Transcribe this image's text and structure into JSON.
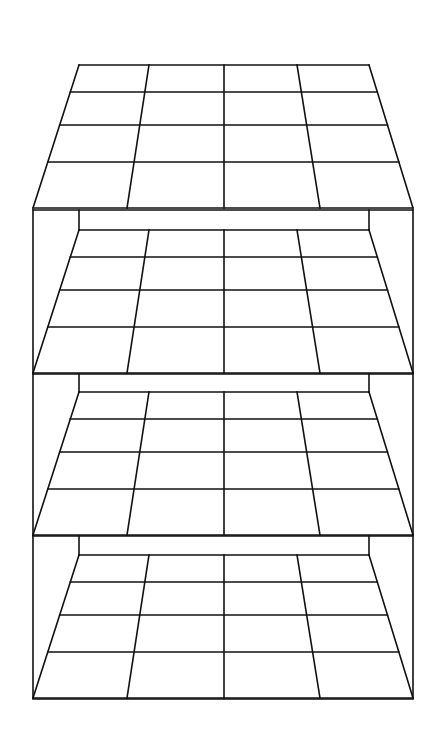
{
  "diagram": {
    "title": "",
    "stroke_color": "#111111",
    "background": "#ffffff",
    "grid": {
      "columns": 4,
      "rows": 4,
      "top_x": [
        79,
        149,
        224,
        297,
        369
      ],
      "bottom_x": [
        33,
        127,
        224,
        320,
        413
      ],
      "row_offsets": [
        0,
        27,
        60,
        97,
        143
      ]
    },
    "box": {
      "left": 33,
      "right": 413,
      "inner_left": 79,
      "inner_right": 369,
      "bottom": 699
    },
    "layers": [
      {
        "name": "layer-1",
        "grid_top": 65,
        "box_top": null
      },
      {
        "name": "layer-2",
        "grid_top": 230,
        "box_top": 210
      },
      {
        "name": "layer-3",
        "grid_top": 392,
        "box_top": 374
      },
      {
        "name": "layer-4",
        "grid_top": 555,
        "box_top": 536
      }
    ]
  }
}
